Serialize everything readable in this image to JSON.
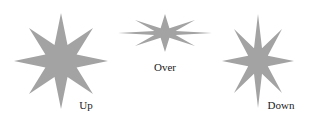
{
  "figure": {
    "star_color": "#a3a3a3",
    "states": [
      {
        "id": "up",
        "label": "Up",
        "cx": 61,
        "cy": 61,
        "rx": 47,
        "ry": 48,
        "dx": 32,
        "dy": 33,
        "inner": 15,
        "label_x": 86,
        "label_y": 109
      },
      {
        "id": "over",
        "label": "Over",
        "cx": 165,
        "cy": 33,
        "rx": 47,
        "ry": 19,
        "dx": 30,
        "dy": 13,
        "inner": 10,
        "label_x": 165,
        "label_y": 71
      },
      {
        "id": "down",
        "label": "Down",
        "cx": 258,
        "cy": 61,
        "rx": 36,
        "ry": 47,
        "dx": 24,
        "dy": 32,
        "inner": 12,
        "label_x": 281,
        "label_y": 109
      }
    ]
  }
}
